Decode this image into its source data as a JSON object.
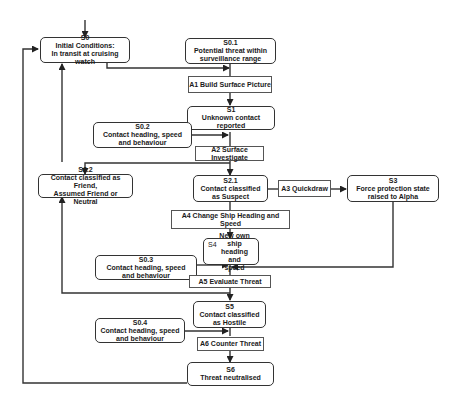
{
  "diagram": {
    "states": {
      "s0": {
        "id": "S0",
        "desc_line1": "Initial Conditions:",
        "desc_line2": "In transit at cruising watch"
      },
      "s0_1": {
        "id": "S0.1",
        "desc_line1": "Potential threat within",
        "desc_line2": "surveillance range"
      },
      "s1": {
        "id": "S1",
        "desc_line1": "Unknown contact reported",
        "desc_line2": ""
      },
      "s0_2": {
        "id": "S0.2",
        "desc_line1": "Contact heading, speed",
        "desc_line2": "and behaviour"
      },
      "s2_2": {
        "id": "S2.2",
        "desc_line1": "Contact classified as Friend,",
        "desc_line2": "Assumed Friend or Neutral"
      },
      "s2_1": {
        "id": "S2.1",
        "desc_line1": "Contact classified",
        "desc_line2": "as Suspect"
      },
      "s3": {
        "id": "S3",
        "desc_line1": "Force protection state",
        "desc_line2": "raised to Alpha"
      },
      "s4": {
        "id": "S4",
        "desc_line1": "New own ship",
        "desc_line2": "heading and",
        "desc_line3": "speed"
      },
      "s0_3": {
        "id": "S0.3",
        "desc_line1": "Contact heading, speed",
        "desc_line2": "and behaviour"
      },
      "s5": {
        "id": "S5",
        "desc_line1": "Contact classified",
        "desc_line2": "as Hostile"
      },
      "s0_4": {
        "id": "S0.4",
        "desc_line1": "Contact heading, speed",
        "desc_line2": "and behaviour"
      },
      "s6": {
        "id": "S6",
        "desc_line1": "Threat neutralised",
        "desc_line2": ""
      }
    },
    "actions": {
      "a1": "A1 Build Surface Picture",
      "a2": "A2 Surface Investigate",
      "a3": "A3 Quickdraw",
      "a4": "A4 Change Ship Heading and Speed",
      "a5": "A5 Evaluate Threat",
      "a6": "A6 Counter Threat"
    },
    "colors": {
      "line": "#333333",
      "box_border": "#333333",
      "background": "#ffffff"
    }
  }
}
